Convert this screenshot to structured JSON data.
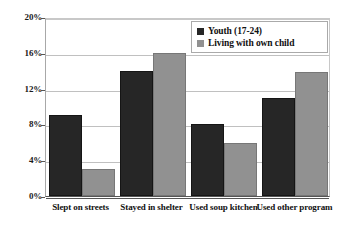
{
  "chart_data": {
    "type": "bar",
    "title": "",
    "xlabel": "",
    "ylabel": "",
    "ylim": [
      0,
      20
    ],
    "ytick_labels": [
      "20%",
      "16%",
      "12%",
      "8%",
      "4%",
      "0%"
    ],
    "ytick_values": [
      20,
      16,
      12,
      8,
      4,
      0
    ],
    "grid": true,
    "legend_position": "top-right",
    "categories": [
      "Slept on streets",
      "Stayed in shelter",
      "Used soup kitchen",
      "Used other program"
    ],
    "series": [
      {
        "name": "Youth (17-24)",
        "color": "#262626",
        "values": [
          9.0,
          14.0,
          8.0,
          11.0
        ]
      },
      {
        "name": "Living with own child",
        "color": "#919191",
        "values": [
          3.0,
          16.0,
          5.9,
          13.8
        ]
      }
    ]
  },
  "colors": {
    "series_a": "#262626",
    "series_b": "#919191",
    "gridline": "#c0c0c0",
    "axis": "#555555",
    "background": "#ffffff"
  }
}
